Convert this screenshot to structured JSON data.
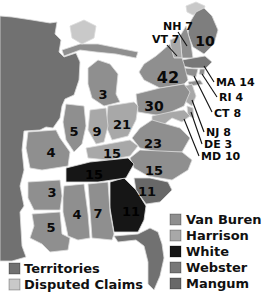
{
  "palette": {
    "van_buren": "#8f8f8f",
    "harrison": "#a8a8a8",
    "white": "#161616",
    "webster": "#787878",
    "mangum": "#686868",
    "territories": "#717171",
    "disputed": "#c9c9c9",
    "maine_shade": "#7e7e7e",
    "border": "#dcdcdc",
    "background": "#ffffff",
    "text": "#0a0a0a"
  },
  "states": [
    {
      "id": "ME",
      "votes": "10",
      "candidate": "van_buren",
      "fill_override": "#7e7e7e"
    },
    {
      "id": "NH",
      "votes": "7",
      "candidate": "van_buren",
      "callout": "NH 7"
    },
    {
      "id": "VT",
      "votes": "7",
      "candidate": "harrison",
      "callout": "VT 7"
    },
    {
      "id": "MA",
      "votes": "14",
      "candidate": "webster",
      "callout": "MA 14"
    },
    {
      "id": "RI",
      "votes": "4",
      "candidate": "van_buren",
      "callout": "RI 4"
    },
    {
      "id": "CT",
      "votes": "8",
      "candidate": "van_buren",
      "callout": "CT 8"
    },
    {
      "id": "NY",
      "votes": "42",
      "candidate": "van_buren"
    },
    {
      "id": "NJ",
      "votes": "8",
      "candidate": "harrison",
      "callout": "NJ 8"
    },
    {
      "id": "PA",
      "votes": "30",
      "candidate": "van_buren"
    },
    {
      "id": "DE",
      "votes": "3",
      "candidate": "harrison",
      "callout": "DE 3"
    },
    {
      "id": "MD",
      "votes": "10",
      "candidate": "harrison",
      "callout": "MD 10"
    },
    {
      "id": "VA",
      "votes": "23",
      "candidate": "van_buren"
    },
    {
      "id": "NC",
      "votes": "15",
      "candidate": "van_buren"
    },
    {
      "id": "SC",
      "votes": "11",
      "candidate": "mangum"
    },
    {
      "id": "GA",
      "votes": "11",
      "candidate": "white",
      "dark_label": true
    },
    {
      "id": "OH",
      "votes": "21",
      "candidate": "harrison"
    },
    {
      "id": "IN",
      "votes": "9",
      "candidate": "harrison"
    },
    {
      "id": "IL",
      "votes": "5",
      "candidate": "van_buren"
    },
    {
      "id": "MI",
      "votes": "3",
      "candidate": "van_buren"
    },
    {
      "id": "KY",
      "votes": "15",
      "candidate": "harrison"
    },
    {
      "id": "TN",
      "votes": "15",
      "candidate": "white",
      "dark_label": true
    },
    {
      "id": "MO",
      "votes": "4",
      "candidate": "van_buren"
    },
    {
      "id": "AR",
      "votes": "3",
      "candidate": "van_buren"
    },
    {
      "id": "LA",
      "votes": "5",
      "candidate": "van_buren"
    },
    {
      "id": "MS",
      "votes": "4",
      "candidate": "van_buren"
    },
    {
      "id": "AL",
      "votes": "7",
      "candidate": "van_buren"
    }
  ],
  "regions": [
    {
      "id": "territory_west",
      "type": "territories"
    },
    {
      "id": "michigan_upper_peninsula",
      "type": "van_buren"
    },
    {
      "id": "florida",
      "type": "territories"
    },
    {
      "id": "long_island",
      "type": "van_buren"
    },
    {
      "id": "maine_north_disputed",
      "type": "disputed"
    },
    {
      "id": "northwest_disputed",
      "type": "disputed"
    }
  ],
  "legend_left": [
    {
      "key": "territories",
      "label": "Territories"
    },
    {
      "key": "disputed",
      "label": "Disputed Claims"
    }
  ],
  "legend_right": [
    {
      "key": "van_buren",
      "label": "Van Buren"
    },
    {
      "key": "harrison",
      "label": "Harrison"
    },
    {
      "key": "white",
      "label": "White"
    },
    {
      "key": "webster",
      "label": "Webster"
    },
    {
      "key": "mangum",
      "label": "Mangum"
    }
  ]
}
